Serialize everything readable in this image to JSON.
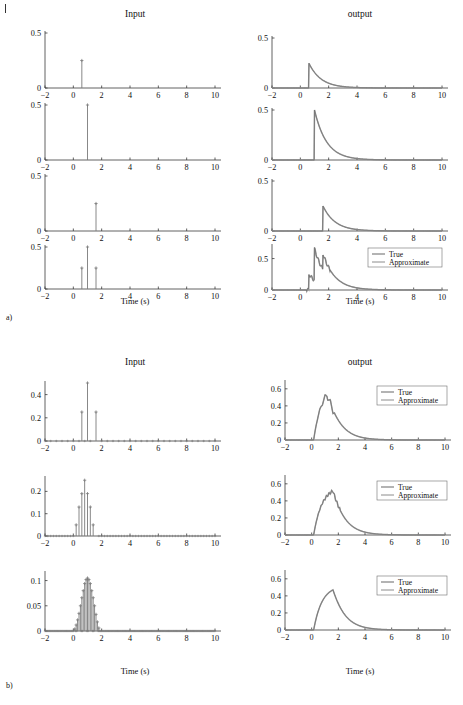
{
  "figure": {
    "corner_marker": "|",
    "sections": [
      {
        "id": "a",
        "label": "a)"
      },
      {
        "id": "b",
        "label": "b)"
      }
    ],
    "column_titles": {
      "input": "Input",
      "output": "output"
    },
    "xlabel": "Time (s)",
    "legend": {
      "true_label": "True",
      "approx_label": "Approximate"
    },
    "colors": {
      "true": "#9a9a9a",
      "approx": "#6e6e6e",
      "axis": "#3a3a3a",
      "stem": "#7a7a7a",
      "text": "#111111"
    }
  },
  "chart_data": [
    {
      "id": "a1-input",
      "type": "bar",
      "title": "Input",
      "section": "a",
      "xlabel": "Time (s)",
      "ylabel": "",
      "xlim": [
        -2,
        10
      ],
      "ylim": [
        0,
        0.5
      ],
      "xticks": [
        -2,
        0,
        2,
        4,
        6,
        8,
        10
      ],
      "yticks": [
        0,
        0.5
      ],
      "ytick_labels": [
        "0",
        "0.5"
      ],
      "grid": false,
      "categories": [
        0.6
      ],
      "values": [
        0.25
      ],
      "description": "single impulse at t=0.6 of height 0.25"
    },
    {
      "id": "a1-output",
      "type": "line",
      "title": "output",
      "section": "a",
      "xlabel": "Time (s)",
      "ylabel": "",
      "xlim": [
        -2,
        10
      ],
      "ylim": [
        0,
        0.5
      ],
      "xticks": [
        -2,
        0,
        2,
        4,
        6,
        8,
        10
      ],
      "yticks": [
        0,
        0.5
      ],
      "ytick_labels": [
        "0",
        "0.5"
      ],
      "grid": false,
      "series": [
        {
          "name": "True",
          "onset": 0.6,
          "peak": 0.25,
          "tau": 0.85
        },
        {
          "name": "Approximate",
          "onset": 0.6,
          "peak": 0.25,
          "tau": 0.85
        }
      ],
      "description": "exponential decay response, rises instantly at t=0.6 to 0.25 then decays"
    },
    {
      "id": "a2-input",
      "type": "bar",
      "title": "Input",
      "section": "a",
      "xlabel": "Time (s)",
      "ylabel": "",
      "xlim": [
        -2,
        10
      ],
      "ylim": [
        0,
        0.5
      ],
      "xticks": [
        -2,
        0,
        2,
        4,
        6,
        8,
        10
      ],
      "yticks": [
        0,
        0.5
      ],
      "ytick_labels": [
        "0",
        "0.5"
      ],
      "grid": false,
      "categories": [
        1.0
      ],
      "values": [
        0.5
      ],
      "description": "single impulse at t=1.0 of height 0.5"
    },
    {
      "id": "a2-output",
      "type": "line",
      "title": "output",
      "section": "a",
      "xlabel": "Time (s)",
      "ylabel": "",
      "xlim": [
        -2,
        10
      ],
      "ylim": [
        0,
        0.5
      ],
      "xticks": [
        -2,
        0,
        2,
        4,
        6,
        8,
        10
      ],
      "yticks": [
        0,
        0.5
      ],
      "ytick_labels": [
        "0",
        "0.5"
      ],
      "grid": false,
      "series": [
        {
          "name": "True",
          "onset": 1.0,
          "peak": 0.5,
          "tau": 0.85
        },
        {
          "name": "Approximate",
          "onset": 1.0,
          "peak": 0.5,
          "tau": 0.85
        }
      ],
      "description": "exponential decay from 0.5 starting at t=1.0"
    },
    {
      "id": "a3-input",
      "type": "bar",
      "title": "Input",
      "section": "a",
      "xlabel": "Time (s)",
      "ylabel": "",
      "xlim": [
        -2,
        10
      ],
      "ylim": [
        0,
        0.5
      ],
      "xticks": [
        -2,
        0,
        2,
        4,
        6,
        8,
        10
      ],
      "yticks": [
        0,
        0.5
      ],
      "ytick_labels": [
        "0",
        "0.5"
      ],
      "grid": false,
      "categories": [
        1.6
      ],
      "values": [
        0.25
      ],
      "description": "single impulse at t=1.6 of height 0.25"
    },
    {
      "id": "a3-output",
      "type": "line",
      "title": "output",
      "section": "a",
      "xlabel": "Time (s)",
      "ylabel": "",
      "xlim": [
        -2,
        10
      ],
      "ylim": [
        0,
        0.5
      ],
      "xticks": [
        -2,
        0,
        2,
        4,
        6,
        8,
        10
      ],
      "yticks": [
        0,
        0.5
      ],
      "ytick_labels": [
        "0",
        "0.5"
      ],
      "grid": false,
      "series": [
        {
          "name": "True",
          "onset": 1.6,
          "peak": 0.25,
          "tau": 0.85
        },
        {
          "name": "Approximate",
          "onset": 1.6,
          "peak": 0.25,
          "tau": 0.85
        }
      ],
      "description": "exponential decay from 0.25 starting at t=1.6"
    },
    {
      "id": "a4-input",
      "type": "bar",
      "title": "Input",
      "section": "a",
      "xlabel": "Time (s)",
      "ylabel": "",
      "xlim": [
        -2,
        10
      ],
      "ylim": [
        0,
        0.5
      ],
      "xticks": [
        -2,
        0,
        2,
        4,
        6,
        8,
        10
      ],
      "yticks": [
        0,
        0.5
      ],
      "ytick_labels": [
        "0",
        "0.5"
      ],
      "grid": false,
      "categories": [
        0.6,
        1.0,
        1.6
      ],
      "values": [
        0.25,
        0.5,
        0.25
      ],
      "description": "sum of three impulses at t=0.6,1.0,1.6"
    },
    {
      "id": "a4-output",
      "type": "line",
      "title": "output",
      "section": "a",
      "xlabel": "Time (s)",
      "ylabel": "",
      "xlim": [
        -2,
        10
      ],
      "ylim": [
        0,
        0.7
      ],
      "xticks": [
        -2,
        0,
        2,
        4,
        6,
        8,
        10
      ],
      "yticks": [
        0,
        0.5
      ],
      "ytick_labels": [
        "0",
        "0.5"
      ],
      "grid": false,
      "legend_position": "upper-right",
      "series": [
        {
          "name": "True",
          "impulses": [
            [
              0.6,
              0.25
            ],
            [
              1.0,
              0.5
            ],
            [
              1.6,
              0.25
            ]
          ],
          "tau": 0.85,
          "peak": 0.62
        },
        {
          "name": "Approximate",
          "impulses": [
            [
              0.6,
              0.25
            ],
            [
              1.0,
              0.5
            ],
            [
              1.6,
              0.25
            ]
          ],
          "tau": 0.85,
          "peak": 0.62
        }
      ],
      "description": "superposition of three decaying exponentials, sawtooth peak ~0.62"
    },
    {
      "id": "b1-input",
      "type": "bar",
      "title": "Input",
      "section": "b",
      "xlabel": "Time (s)",
      "ylabel": "",
      "xlim": [
        -2,
        10
      ],
      "ylim": [
        0,
        0.5
      ],
      "xticks": [
        -2,
        0,
        2,
        4,
        6,
        8,
        10
      ],
      "yticks": [
        0,
        0.2,
        0.4
      ],
      "ytick_labels": [
        "0",
        "0.2",
        "0.4"
      ],
      "grid": false,
      "categories": [
        0.6,
        1.0,
        1.6
      ],
      "values": [
        0.25,
        0.5,
        0.25
      ],
      "sample_step": 0.4,
      "description": "coarse sampling, three nonzero impulses, zeros elsewhere"
    },
    {
      "id": "b1-output",
      "type": "line",
      "title": "output",
      "section": "b",
      "xlabel": "Time (s)",
      "ylabel": "",
      "xlim": [
        -2,
        10
      ],
      "ylim": [
        0,
        0.68
      ],
      "xticks": [
        -2,
        0,
        2,
        4,
        6,
        8,
        10
      ],
      "yticks": [
        0,
        0.2,
        0.4,
        0.6
      ],
      "ytick_labels": [
        "0",
        "0.2",
        "0.4",
        "0.6"
      ],
      "grid": false,
      "legend_position": "upper-right",
      "series": [
        {
          "name": "True",
          "peak": 0.65,
          "peak_t": 1.15,
          "tau": 0.85,
          "jagged": true
        },
        {
          "name": "Approximate",
          "peak": 0.65,
          "peak_t": 1.15,
          "tau": 0.85,
          "jagged": true
        }
      ],
      "description": "jagged superposition peaking ~0.65 near t=1.2, decaying to zero by t=6"
    },
    {
      "id": "b2-input",
      "type": "bar",
      "title": "Input",
      "section": "b",
      "xlabel": "Time (s)",
      "ylabel": "",
      "xlim": [
        -2,
        10
      ],
      "ylim": [
        0,
        0.26
      ],
      "xticks": [
        -2,
        0,
        2,
        4,
        6,
        8,
        10
      ],
      "yticks": [
        0,
        0.1,
        0.2
      ],
      "ytick_labels": [
        "0",
        "0.1",
        "0.2"
      ],
      "grid": false,
      "categories": [
        0.2,
        0.4,
        0.6,
        0.8,
        1.0,
        1.2,
        1.4,
        1.6
      ],
      "values": [
        0.05,
        0.13,
        0.19,
        0.25,
        0.19,
        0.13,
        0.05,
        0.0
      ],
      "sample_step": 0.2,
      "description": "medium sampling approximating a bell shape, peak 0.25 at t=0.8-1.0"
    },
    {
      "id": "b2-output",
      "type": "line",
      "title": "output",
      "section": "b",
      "xlabel": "Time (s)",
      "ylabel": "",
      "xlim": [
        -2,
        10
      ],
      "ylim": [
        0,
        0.68
      ],
      "xticks": [
        -2,
        0,
        2,
        4,
        6,
        8,
        10
      ],
      "yticks": [
        0,
        0.2,
        0.4,
        0.6
      ],
      "ytick_labels": [
        "0",
        "0.2",
        "0.4",
        "0.6"
      ],
      "grid": false,
      "legend_position": "upper-right",
      "series": [
        {
          "name": "True",
          "peak": 0.56,
          "peak_t": 1.6,
          "tau": 0.85,
          "jagged": true
        },
        {
          "name": "Approximate",
          "peak": 0.56,
          "peak_t": 1.6,
          "tau": 0.85,
          "jagged": true
        }
      ],
      "description": "staircase-rise curve peaking ~0.56 at t=1.6, smooth decay"
    },
    {
      "id": "b3-input",
      "type": "bar",
      "title": "Input",
      "section": "b",
      "xlabel": "Time (s)",
      "ylabel": "",
      "xlim": [
        -2,
        10
      ],
      "ylim": [
        0,
        0.115
      ],
      "xticks": [
        -2,
        0,
        2,
        4,
        6,
        8,
        10
      ],
      "yticks": [
        0,
        0.05,
        0.1
      ],
      "ytick_labels": [
        "0",
        "0.05",
        "0.1"
      ],
      "grid": false,
      "categories": [
        0.1,
        0.2,
        0.3,
        0.4,
        0.5,
        0.6,
        0.7,
        0.8,
        0.9,
        1.0,
        1.1,
        1.2,
        1.3,
        1.4,
        1.5,
        1.6,
        1.7,
        1.8
      ],
      "values": [
        0.004,
        0.012,
        0.022,
        0.035,
        0.05,
        0.066,
        0.08,
        0.094,
        0.102,
        0.105,
        0.102,
        0.094,
        0.08,
        0.066,
        0.05,
        0.033,
        0.018,
        0.006
      ],
      "sample_step": 0.08,
      "description": "dense sampling forming a filled Gaussian pulse, peak 0.105 at t=1.0"
    },
    {
      "id": "b3-output",
      "type": "line",
      "title": "output",
      "section": "b",
      "xlabel": "Time (s)",
      "ylabel": "",
      "xlim": [
        -2,
        10
      ],
      "ylim": [
        0,
        0.68
      ],
      "xticks": [
        -2,
        0,
        2,
        4,
        6,
        8,
        10
      ],
      "yticks": [
        0,
        0.2,
        0.4,
        0.6
      ],
      "ytick_labels": [
        "0",
        "0.2",
        "0.4",
        "0.6"
      ],
      "grid": false,
      "legend_position": "upper-right",
      "series": [
        {
          "name": "True",
          "peak": 0.51,
          "peak_t": 1.6,
          "tau": 0.85,
          "jagged": false
        },
        {
          "name": "Approximate",
          "peak": 0.51,
          "peak_t": 1.6,
          "tau": 0.85,
          "jagged": false
        }
      ],
      "description": "smooth convolution curve peaking ~0.51 at t=1.6, decaying to zero by t=6"
    }
  ]
}
